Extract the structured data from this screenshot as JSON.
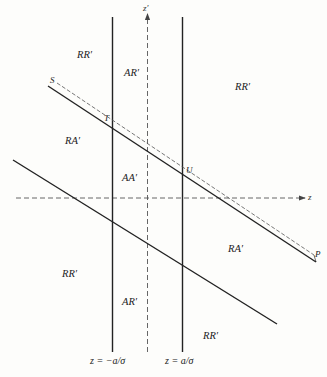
{
  "diagram": {
    "axes": {
      "horizontal_label": "z",
      "vertical_label": "z′"
    },
    "boundaries": {
      "left_label": "z = −a/σ",
      "right_label": "z = a/σ"
    },
    "points": {
      "S": "S",
      "T": "T",
      "U": "U",
      "P": "P"
    },
    "regions": {
      "rr_top_left": "RR′",
      "ar_top": "AR′",
      "rr_top_right": "RR′",
      "ra_left": "RA′",
      "aa_center": "AA′",
      "ra_right": "RA′",
      "rr_bottom_left": "RR′",
      "ar_bottom": "AR′",
      "rr_bottom_right": "RR′"
    },
    "colors": {
      "line": "#222222",
      "dashed": "#555555",
      "background": "#fdfdfb"
    }
  }
}
